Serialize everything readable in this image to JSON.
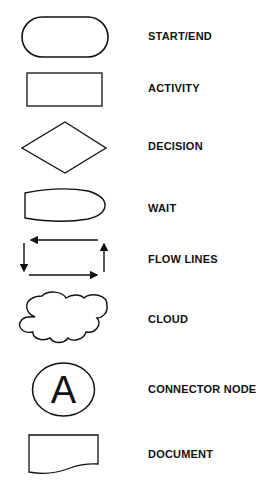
{
  "legend": {
    "items": [
      {
        "shape": "start-end-terminator",
        "label": "START/END"
      },
      {
        "shape": "activity-rectangle",
        "label": "ACTIVITY"
      },
      {
        "shape": "decision-diamond",
        "label": "DECISION"
      },
      {
        "shape": "wait-bullet",
        "label": "WAIT"
      },
      {
        "shape": "flow-lines-arrows",
        "label": "FLOW LINES"
      },
      {
        "shape": "cloud",
        "label": "CLOUD"
      },
      {
        "shape": "connector-circle",
        "label": "CONNECTOR NODE",
        "symbol": "A"
      },
      {
        "shape": "document",
        "label": "DOCUMENT"
      }
    ]
  },
  "colors": {
    "stroke": "#111111",
    "background": "#ffffff",
    "text": "#111111"
  }
}
